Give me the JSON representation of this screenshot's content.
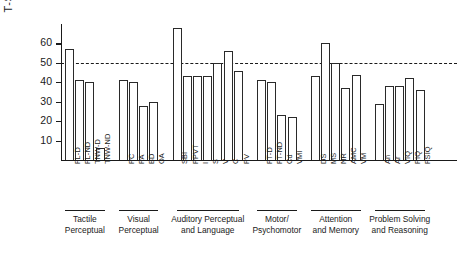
{
  "chart_data": {
    "type": "bar",
    "title": "",
    "xlabel": "",
    "ylabel": "T-SCORE",
    "ylim": [
      0,
      70
    ],
    "yticks": [
      10,
      20,
      30,
      40,
      50,
      60
    ],
    "ytick_labels": [
      "10",
      "20",
      "30",
      "40",
      "50",
      "60"
    ],
    "grid": false,
    "legend": "none",
    "reference_line": {
      "value": 50,
      "style": "dashed",
      "label": ""
    },
    "categories": [
      "FL-D",
      "FL-ND",
      "TNW-D",
      "TNW-ND",
      "PC",
      "PA",
      "BD",
      "OA",
      "SBI",
      "PPVT",
      "I",
      "S",
      "V",
      "C",
      "PV",
      "FT-D",
      "FT-ND",
      "Cd",
      "VMI",
      "DS",
      "MS",
      "NR",
      "AMC",
      "VM",
      "An",
      "Ar",
      "VIQ",
      "PIQ",
      "FSIQ"
    ],
    "values": [
      57,
      41,
      40,
      6,
      41,
      40,
      28,
      30,
      68,
      43,
      43,
      43,
      50,
      56,
      46,
      41,
      40,
      23,
      22,
      43,
      60,
      50,
      37,
      44,
      29,
      38,
      38,
      42,
      36
    ],
    "groups": [
      {
        "label": "Tactile\nPerceptual",
        "line1": "Tactile",
        "line2": "Perceptual",
        "start": 0,
        "count": 4
      },
      {
        "label": "Visual\nPerceptual",
        "line1": "Visual",
        "line2": "Perceptual",
        "start": 4,
        "count": 4
      },
      {
        "label": "Auditory Perceptual\nand Language",
        "line1": "Auditory Perceptual",
        "line2": "and Language",
        "start": 8,
        "count": 7
      },
      {
        "label": "Motor/\nPsychomotor",
        "line1": "Motor/",
        "line2": "Psychomotor",
        "start": 15,
        "count": 4
      },
      {
        "label": "Attention\nand Memory",
        "line1": "Attention",
        "line2": "and Memory",
        "start": 19,
        "count": 5
      },
      {
        "label": "Problem Solving\nand Reasoning",
        "line1": "Problem Solving",
        "line2": "and Reasoning",
        "start": 24,
        "count": 5
      }
    ],
    "colors": {
      "bar_stroke": "#2a2a2a",
      "bar_fill": "#ffffff",
      "axis": "#1a1a1a",
      "reference_line": "#1a1a1a",
      "background": "#ffffff"
    }
  }
}
